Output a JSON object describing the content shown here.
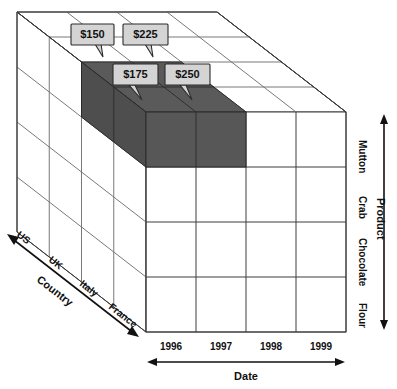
{
  "figure": {
    "type": "3d-cube-diagram"
  },
  "axes": {
    "product": {
      "label": "Product",
      "name": "product-axis",
      "ticks": [
        "Mutton",
        "Crab",
        "Chocolate",
        "Flour"
      ]
    },
    "date": {
      "label": "Date",
      "name": "date-axis",
      "ticks": [
        "1996",
        "1997",
        "1998",
        "1999"
      ]
    },
    "country": {
      "label": "Country",
      "name": "country-axis",
      "ticks": [
        "US",
        "UK",
        "Italy",
        "France"
      ]
    }
  },
  "callouts": [
    {
      "value": "$150",
      "cell": "US / Mutton / 1996"
    },
    {
      "value": "$225",
      "cell": "US / Mutton / 1997"
    },
    {
      "value": "$175",
      "cell": "UK / Mutton / 1996"
    },
    {
      "value": "$250",
      "cell": "UK / Mutton / 1997"
    }
  ],
  "selection": {
    "description": "Highlighted cells: Mutton product, years 1996 and 1997, countries US and UK",
    "color": "#575757"
  },
  "colors": {
    "cube_stroke": "#3c3c3c",
    "cube_fill": "#ffffff",
    "selection_fill": "#575757",
    "callout_fill": "#d4d4d4",
    "callout_stroke": "#2b2b2b",
    "text": "#111111"
  }
}
